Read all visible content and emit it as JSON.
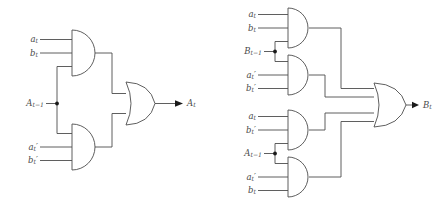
{
  "figure": {
    "kind": "logic-circuit-diagram",
    "stroke_color": "#4d4d4d",
    "label_color": "#4a4a4a",
    "background_color": "#ffffff"
  },
  "circuits": [
    {
      "id": "circuit-a",
      "output": {
        "label": "A",
        "sub": "t"
      },
      "shared_input": {
        "label": "A",
        "sub": "t−1"
      },
      "or_gate": {
        "name": "or-gate-a",
        "inputs": 2
      },
      "and_gates": [
        {
          "name": "and-gate-a1",
          "inputs": [
            {
              "label": "a",
              "sub": "t",
              "prime": false
            },
            {
              "label": "b",
              "sub": "t",
              "prime": false
            },
            {
              "label": "A",
              "sub": "t−1",
              "prime": false,
              "shared": true
            }
          ]
        },
        {
          "name": "and-gate-a2",
          "inputs": [
            {
              "label": "A",
              "sub": "t−1",
              "prime": false,
              "shared": true
            },
            {
              "label": "a",
              "sub": "t",
              "prime": true
            },
            {
              "label": "b",
              "sub": "t",
              "prime": true
            }
          ]
        }
      ]
    },
    {
      "id": "circuit-b",
      "output": {
        "label": "B",
        "sub": "t"
      },
      "or_gate": {
        "name": "or-gate-b",
        "inputs": 4
      },
      "and_gates": [
        {
          "name": "and-gate-b1",
          "inputs": [
            {
              "label": "a",
              "sub": "t",
              "prime": false
            },
            {
              "label": "b",
              "sub": "t",
              "prime": false
            },
            {
              "label": "B",
              "sub": "t−1",
              "prime": false,
              "shared": true
            }
          ]
        },
        {
          "name": "and-gate-b2",
          "inputs": [
            {
              "label": "B",
              "sub": "t−1",
              "prime": false,
              "shared": true
            },
            {
              "label": "a",
              "sub": "t",
              "prime": true
            },
            {
              "label": "b",
              "sub": "t",
              "prime": true
            }
          ]
        },
        {
          "name": "and-gate-b3",
          "inputs": [
            {
              "label": "a",
              "sub": "t",
              "prime": false
            },
            {
              "label": "b",
              "sub": "t",
              "prime": true
            },
            {
              "label": "A",
              "sub": "t−1",
              "prime": false,
              "shared": true
            }
          ]
        },
        {
          "name": "and-gate-b4",
          "inputs": [
            {
              "label": "A",
              "sub": "t−1",
              "prime": false,
              "shared": true
            },
            {
              "label": "a",
              "sub": "t",
              "prime": true
            },
            {
              "label": "b",
              "sub": "t",
              "prime": false
            }
          ]
        }
      ]
    }
  ],
  "labels": {
    "left": {
      "in_a_t": "a",
      "in_a_t_sub": "t",
      "in_b_t": "b",
      "in_b_t_sub": "t",
      "carry_in": "A",
      "carry_in_sub": "t−1",
      "in_a_t_prime": "a",
      "in_a_t_prime_sub": "t",
      "in_a_t_prime_mark": "′",
      "in_b_t_prime": "b",
      "in_b_t_prime_sub": "t",
      "in_b_t_prime_mark": "′",
      "out": "A",
      "out_sub": "t"
    },
    "right": {
      "g1_a": "a",
      "g1_a_sub": "t",
      "g1_b": "b",
      "g1_b_sub": "t",
      "carry_b": "B",
      "carry_b_sub": "t−1",
      "g2_a": "a",
      "g2_a_sub": "t",
      "g2_a_mark": "′",
      "g2_b": "b",
      "g2_b_sub": "t",
      "g2_b_mark": "′",
      "g3_a": "a",
      "g3_a_sub": "t",
      "g3_b": "b",
      "g3_b_sub": "t",
      "g3_b_mark": "′",
      "carry_a": "A",
      "carry_a_sub": "t−1",
      "g4_a": "a",
      "g4_a_sub": "t",
      "g4_a_mark": "′",
      "g4_b": "b",
      "g4_b_sub": "t",
      "out": "B",
      "out_sub": "t"
    }
  }
}
